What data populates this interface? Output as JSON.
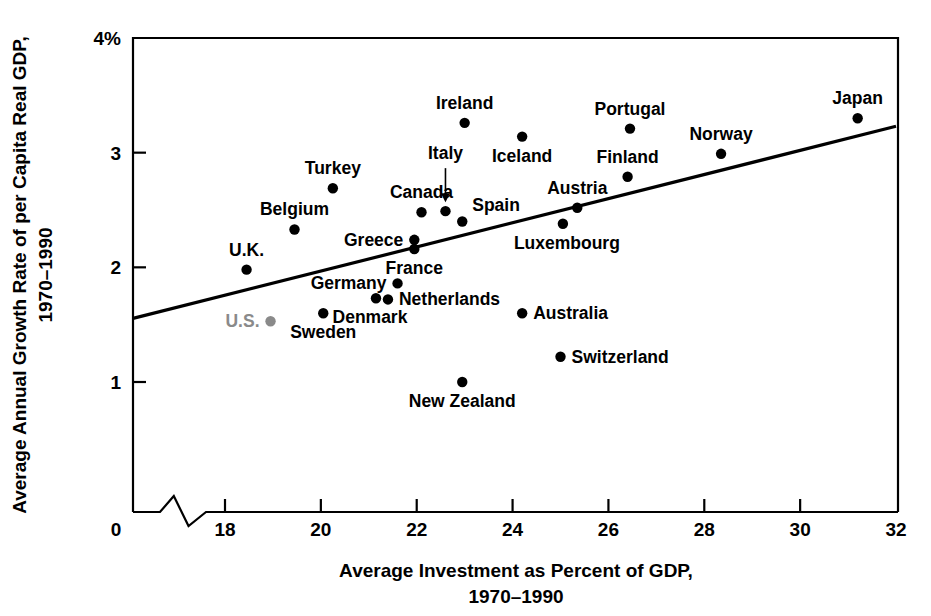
{
  "chart_data": {
    "type": "scatter",
    "title": "",
    "xlabel": "Average Investment as Percent of GDP, 1970–1990",
    "xlabel_line1": "Average Investment as Percent of GDP,",
    "xlabel_line2": "1970–1990",
    "ylabel": "Average Annual Growth Rate of per Capita Real GDP, 1970–1990",
    "ylabel_line1": "Average Annual Growth Rate of per Capita Real GDP,",
    "ylabel_line2": "1970–1990",
    "xlim": [
      17.0,
      32.0
    ],
    "ylim": [
      0.0,
      4.0
    ],
    "x_axis_break": true,
    "x_origin_label": "0",
    "xticks": [
      18,
      20,
      22,
      24,
      26,
      28,
      30,
      32
    ],
    "xticklabels": [
      "18",
      "20",
      "22",
      "24",
      "26",
      "28",
      "30",
      "32"
    ],
    "yticks": [
      1,
      2,
      3,
      4
    ],
    "yticklabels": [
      "1",
      "2",
      "3",
      "4%"
    ],
    "grid": false,
    "legend": "none",
    "marker_color": "#000000",
    "highlight_color": "#8a8a8a",
    "trendline": {
      "label": "regression-line",
      "x0": 17.0,
      "y0": 1.555,
      "x1": 32.0,
      "y1": 3.23,
      "color": "#000000"
    },
    "points": [
      {
        "name": "U.K.",
        "x": 18.45,
        "y": 1.98,
        "label_pos": "above-left",
        "highlight": false
      },
      {
        "name": "Belgium",
        "x": 19.45,
        "y": 2.33,
        "label_pos": "above",
        "highlight": false
      },
      {
        "name": "U.S.",
        "x": 18.95,
        "y": 1.53,
        "label_pos": "left",
        "highlight": true
      },
      {
        "name": "Turkey",
        "x": 20.25,
        "y": 2.69,
        "label_pos": "above",
        "highlight": false
      },
      {
        "name": "Denmark",
        "x": 21.15,
        "y": 1.73,
        "label_pos": "below-left",
        "highlight": false
      },
      {
        "name": "Sweden",
        "x": 20.05,
        "y": 1.6,
        "label_pos": "below",
        "highlight": false
      },
      {
        "name": "Germany",
        "x": 21.6,
        "y": 1.86,
        "label_pos": "left",
        "highlight": false
      },
      {
        "name": "Netherlands",
        "x": 21.4,
        "y": 1.72,
        "label_pos": "right",
        "highlight": false
      },
      {
        "name": "Greece",
        "x": 21.95,
        "y": 2.24,
        "label_pos": "left",
        "highlight": false
      },
      {
        "name": "France",
        "x": 21.95,
        "y": 2.16,
        "label_pos": "below",
        "highlight": false
      },
      {
        "name": "Canada",
        "x": 22.1,
        "y": 2.48,
        "label_pos": "above",
        "highlight": false
      },
      {
        "name": "Italy",
        "x": 22.6,
        "y": 2.49,
        "label_pos": "arrow-above",
        "highlight": false
      },
      {
        "name": "Ireland",
        "x": 23.0,
        "y": 3.26,
        "label_pos": "above",
        "highlight": false
      },
      {
        "name": "Spain",
        "x": 22.95,
        "y": 2.4,
        "label_pos": "above-right",
        "highlight": false
      },
      {
        "name": "New Zealand",
        "x": 22.95,
        "y": 1.0,
        "label_pos": "below",
        "highlight": false
      },
      {
        "name": "Iceland",
        "x": 24.2,
        "y": 3.14,
        "label_pos": "below",
        "highlight": false
      },
      {
        "name": "Australia",
        "x": 24.2,
        "y": 1.6,
        "label_pos": "right",
        "highlight": false
      },
      {
        "name": "Switzerland",
        "x": 25.0,
        "y": 1.22,
        "label_pos": "right",
        "highlight": false
      },
      {
        "name": "Austria",
        "x": 25.35,
        "y": 2.52,
        "label_pos": "above",
        "highlight": false
      },
      {
        "name": "Luxembourg",
        "x": 25.05,
        "y": 2.38,
        "label_pos": "below-right",
        "highlight": false
      },
      {
        "name": "Portugal",
        "x": 26.45,
        "y": 3.21,
        "label_pos": "above",
        "highlight": false
      },
      {
        "name": "Finland",
        "x": 26.4,
        "y": 2.79,
        "label_pos": "above",
        "highlight": false
      },
      {
        "name": "Norway",
        "x": 28.35,
        "y": 2.99,
        "label_pos": "above",
        "highlight": false
      },
      {
        "name": "Japan",
        "x": 31.2,
        "y": 3.3,
        "label_pos": "above",
        "highlight": false
      }
    ]
  }
}
